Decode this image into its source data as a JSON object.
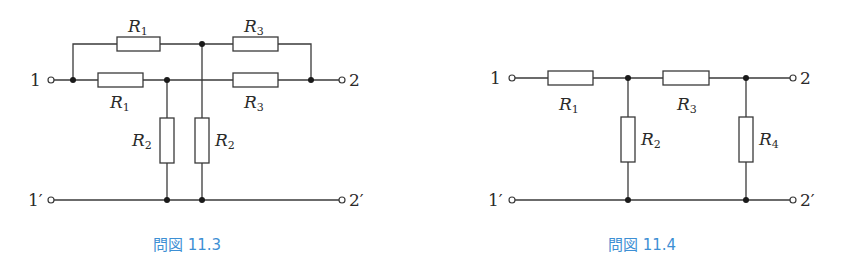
{
  "figures": [
    {
      "caption": "問図 11.3",
      "terminals": {
        "in_top": "1",
        "in_bottom": "1′",
        "out_top": "2",
        "out_bottom": "2′"
      },
      "resistors": {
        "r1_top": {
          "name": "R",
          "sub": "1"
        },
        "r1_mid": {
          "name": "R",
          "sub": "1"
        },
        "r3_top": {
          "name": "R",
          "sub": "3"
        },
        "r3_mid": {
          "name": "R",
          "sub": "3"
        },
        "r2_left": {
          "name": "R",
          "sub": "2"
        },
        "r2_right": {
          "name": "R",
          "sub": "2"
        }
      }
    },
    {
      "caption": "問図 11.4",
      "terminals": {
        "in_top": "1",
        "in_bottom": "1′",
        "out_top": "2",
        "out_bottom": "2′"
      },
      "resistors": {
        "r1": {
          "name": "R",
          "sub": "1"
        },
        "r2": {
          "name": "R",
          "sub": "2"
        },
        "r3": {
          "name": "R",
          "sub": "3"
        },
        "r4": {
          "name": "R",
          "sub": "4"
        }
      }
    }
  ],
  "colors": {
    "caption": "#3d8fd4",
    "wire": "#3a3a3a"
  }
}
